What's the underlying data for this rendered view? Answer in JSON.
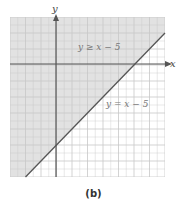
{
  "chart_data": {
    "type": "area",
    "title": "",
    "caption": "(b)",
    "xlabel": "x",
    "ylabel": "y",
    "xlim": [
      -3,
      7
    ],
    "ylim": [
      -7,
      3
    ],
    "grid": true,
    "series": [
      {
        "name": "y = x − 5",
        "kind": "boundary-line",
        "slope": 1,
        "intercept": -5,
        "style": "solid"
      },
      {
        "name": "y ≥ x − 5",
        "kind": "shaded-region",
        "side": "above"
      }
    ],
    "annotations": [
      {
        "text": "y ≥ x − 5",
        "x": 3,
        "y": 1.6
      },
      {
        "text": "y = x − 5",
        "x": 4.6,
        "y": -1.9
      }
    ],
    "colors": {
      "shade": "#e2e2e2",
      "grid": "#c8c8c8",
      "axis": "#555555",
      "line": "#555555"
    }
  },
  "labels": {
    "x_axis": "x",
    "y_axis": "y",
    "region": "y ≥ x − 5",
    "line": "y = x − 5",
    "caption": "(b)"
  }
}
